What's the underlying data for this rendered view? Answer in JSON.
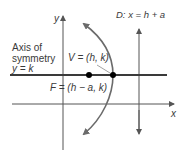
{
  "diagram": {
    "type": "parabola-horizontal-left",
    "colors": {
      "axis": "#555555",
      "symmetry_line": "#3a3a3a",
      "parabola": "#6b6b6b",
      "point": "#000000",
      "text": "#3a3a3a"
    },
    "axes": {
      "x_label": "x",
      "y_label": "y"
    },
    "directrix": {
      "label": "D: x = h + a"
    },
    "axis_of_symmetry": {
      "line1": "Axis of",
      "line2": "symmetry",
      "equation": "y = k"
    },
    "vertex": {
      "label": "V = (h, k)"
    },
    "focus": {
      "label": "F = (h − a, k)"
    }
  }
}
